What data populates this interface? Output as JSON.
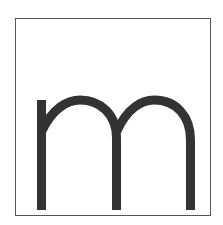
{
  "tile": {
    "letter": "m",
    "stroke_color": "#333333",
    "border_color": "#555555",
    "background_color": "#ffffff"
  }
}
